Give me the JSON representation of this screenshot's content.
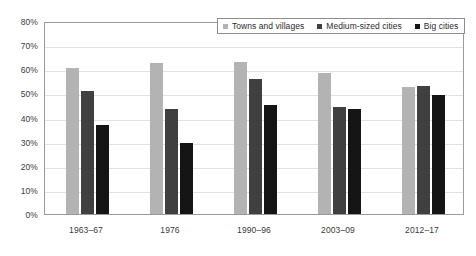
{
  "chart_data": {
    "type": "bar",
    "title": "",
    "subtitle": "",
    "xlabel": "",
    "ylabel": "",
    "categories": [
      "1963–67",
      "1976",
      "1990–96",
      "2003–09",
      "2012–17"
    ],
    "series": [
      {
        "name": "Towns and villages",
        "color": "#b3b3b3",
        "values": [
          60.5,
          62.5,
          63.0,
          58.5,
          52.5
        ]
      },
      {
        "name": "Medium-sized cities",
        "color": "#404040",
        "values": [
          51.0,
          43.5,
          56.0,
          44.5,
          53.0
        ]
      },
      {
        "name": "Big cities",
        "color": "#151515",
        "values": [
          37.0,
          29.5,
          45.0,
          43.5,
          49.5
        ]
      }
    ],
    "ylim": [
      0,
      80
    ],
    "ytick_values": [
      0,
      10,
      20,
      30,
      40,
      50,
      60,
      70,
      80
    ],
    "ytick_labels": [
      "0%",
      "10%",
      "20%",
      "30%",
      "40%",
      "50%",
      "60%",
      "70%",
      "80%"
    ],
    "grid": true,
    "grid_axis": "y",
    "legend_position": "top-right",
    "legend_entries": [
      "Towns and villages",
      "Medium-sized cities",
      "Big cities"
    ],
    "annotations": []
  },
  "colors": {
    "series_1": "#b3b3b3",
    "series_2": "#404040",
    "series_3": "#151515",
    "gridline": "#e2e2e2",
    "axis_border": "#9a9a9a",
    "legend_border": "#8d8d8d",
    "text": "#3a3a3a",
    "background": "#ffffff"
  }
}
